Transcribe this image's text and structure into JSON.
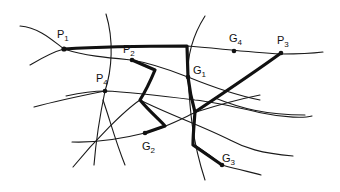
{
  "diagram": {
    "type": "network-graph",
    "nodes": [
      {
        "id": "P1",
        "letter": "P",
        "sub": "1",
        "x": 64,
        "y": 49
      },
      {
        "id": "P2",
        "letter": "P",
        "sub": "2",
        "x": 132,
        "y": 60
      },
      {
        "id": "P3",
        "letter": "P",
        "sub": "3",
        "x": 281,
        "y": 53
      },
      {
        "id": "P4",
        "letter": "P",
        "sub": "4",
        "x": 105,
        "y": 91
      },
      {
        "id": "G1",
        "letter": "G",
        "sub": "1",
        "x": 188,
        "y": 77
      },
      {
        "id": "G2",
        "letter": "G",
        "sub": "2",
        "x": 145,
        "y": 133
      },
      {
        "id": "G3",
        "letter": "G",
        "sub": "3",
        "x": 222,
        "y": 165
      },
      {
        "id": "G4",
        "letter": "G",
        "sub": "4",
        "x": 234,
        "y": 51
      }
    ],
    "highlighted_routes": [
      "P1 - G1 - G3",
      "P3 - junction",
      "P2 - G2"
    ],
    "colors": {
      "line": "#111111",
      "background": "#ffffff"
    }
  }
}
